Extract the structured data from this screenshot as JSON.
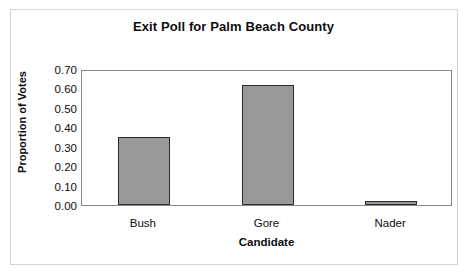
{
  "chart_data": {
    "type": "bar",
    "title": "Exit Poll for Palm Beach County",
    "xlabel": "Candidate",
    "ylabel": "Proportion of Votes",
    "categories": [
      "Bush",
      "Gore",
      "Nader"
    ],
    "values": [
      0.35,
      0.62,
      0.02
    ],
    "ylim": [
      0.0,
      0.7
    ],
    "ytick_labels": [
      "0.70",
      "0.60",
      "0.50",
      "0.40",
      "0.30",
      "0.20",
      "0.10",
      "0.00"
    ],
    "ytick_values": [
      0.7,
      0.6,
      0.5,
      0.4,
      0.3,
      0.2,
      0.1,
      0.0
    ],
    "ytick_step": 0.1,
    "grid": false,
    "legend": false,
    "bar_fill_color": "#999999",
    "bar_border_color": "#2b2b2b",
    "plot_border_color": "#8a8a8a",
    "frame_color": "#d4d4d4",
    "text_color": "#0d0d0d"
  }
}
